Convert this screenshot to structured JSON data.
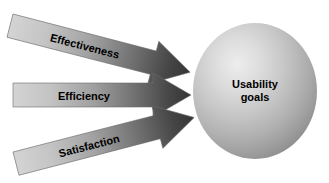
{
  "diagram": {
    "type": "arrows-to-sphere",
    "background_color": "#ffffff",
    "arrows": [
      {
        "id": "effectiveness",
        "label": "Effectiveness",
        "direction": "right",
        "angle_deg": 15,
        "gradient_from": "#cfcfcf",
        "gradient_to": "#3a3a3a",
        "label_color": "#000000"
      },
      {
        "id": "efficiency",
        "label": "Efficiency",
        "direction": "right",
        "angle_deg": 0,
        "gradient_from": "#cfcfcf",
        "gradient_to": "#3a3a3a",
        "label_color": "#000000"
      },
      {
        "id": "satisfaction",
        "label": "Satisfaction",
        "direction": "right",
        "angle_deg": -15,
        "gradient_from": "#cfcfcf",
        "gradient_to": "#3a3a3a",
        "label_color": "#000000"
      }
    ],
    "sphere": {
      "id": "usability-goals",
      "label_line_1": "Usability",
      "label_line_2": "goals",
      "highlight_color": "#e3e3e3",
      "mid_color": "#b8b8b8",
      "edge_color": "#909090",
      "label_color": "#000000"
    }
  }
}
